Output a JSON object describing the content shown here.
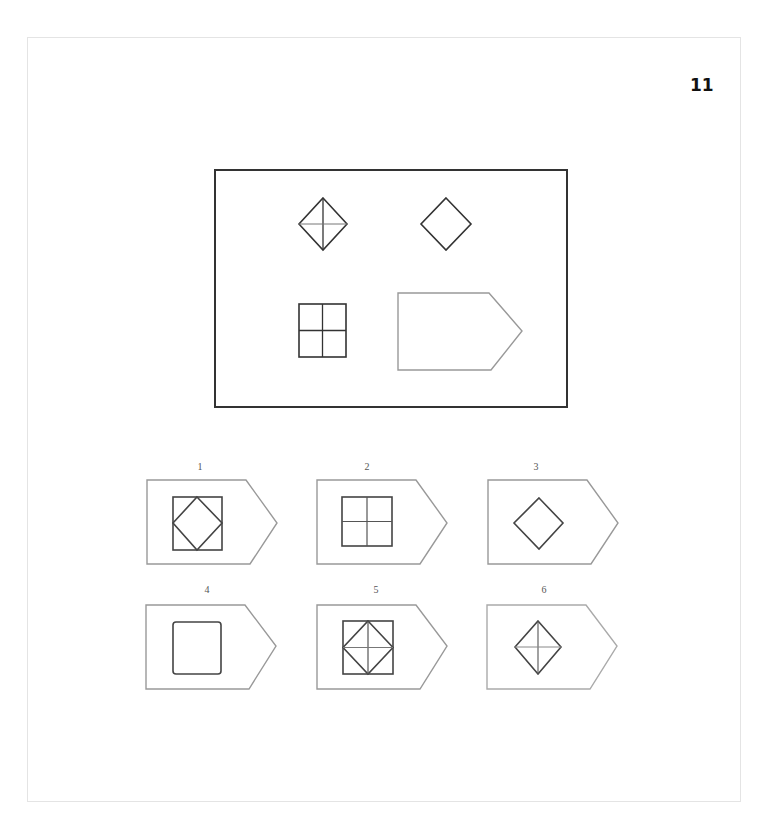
{
  "page": {
    "number": "11"
  },
  "question": {
    "cells": [
      {
        "position": "top-left",
        "shape": "diamond-with-cross"
      },
      {
        "position": "top-right",
        "shape": "diamond"
      },
      {
        "position": "bottom-left",
        "shape": "square-with-cross"
      },
      {
        "position": "bottom-right",
        "shape": "empty-pentagon-card"
      }
    ]
  },
  "options": [
    {
      "label": "1",
      "shape": "square-with-inscribed-diamond"
    },
    {
      "label": "2",
      "shape": "square-with-cross"
    },
    {
      "label": "3",
      "shape": "diamond"
    },
    {
      "label": "4",
      "shape": "square"
    },
    {
      "label": "5",
      "shape": "square-with-diamond-and-cross"
    },
    {
      "label": "6",
      "shape": "diamond-with-cross"
    }
  ],
  "colors": {
    "stroke": "#333333",
    "light_stroke": "#9a9a9a",
    "frame": "#e4e4e4"
  }
}
